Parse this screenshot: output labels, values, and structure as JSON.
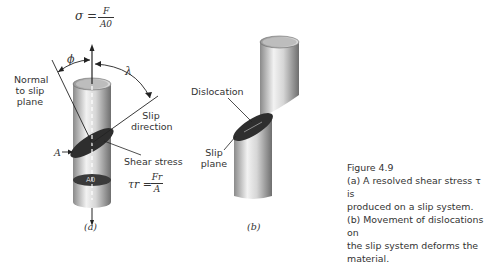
{
  "figure": {
    "number_label": "Figure 4.9",
    "caption_lines": [
      "(a) A resolved shear stress τ is",
      "produced on a slip system.",
      "(b) Movement of dislocations on",
      "the slip system deforms the material."
    ]
  },
  "panel_a": {
    "sublabel": "(a)",
    "sigma_lhs": "σ =",
    "sigma_num": "F",
    "sigma_den": "A0",
    "phi": "ϕ",
    "lambda": "λ",
    "normal_label": [
      "Normal",
      "to slip",
      "plane"
    ],
    "slip_direction_label": [
      "Slip",
      "direction"
    ],
    "area_label": "A",
    "area0_label": "A0",
    "shear_stress_label": "Shear stress",
    "tau_lhs": "τr =",
    "tau_num": "Fr",
    "tau_den": "A"
  },
  "panel_b": {
    "sublabel": "(b)",
    "dislocation_label": "Dislocation",
    "slip_plane_label": [
      "Slip",
      "plane"
    ]
  },
  "colors": {
    "cylinder_dark": "#7a7a7a",
    "cylinder_light": "#f0f0f0",
    "plane_dark": "#2e2e2e",
    "text": "#333333"
  }
}
